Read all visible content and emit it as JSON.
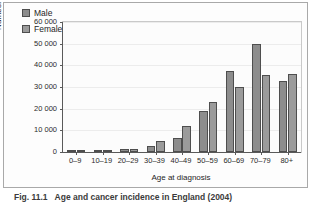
{
  "figure": {
    "caption_number": "Fig. 11.1",
    "caption_text": "Age and cancer incidence in England (2004)"
  },
  "legend": {
    "position": "top-left-inside",
    "items": [
      {
        "label": "Male",
        "color": "#8d8d8d"
      },
      {
        "label": "Female",
        "color": "#9b9b9b"
      }
    ]
  },
  "axes": {
    "y_title": "Number of new cases",
    "x_title": "Age at diagnosis",
    "y_ticks": [
      "0",
      "10 000",
      "20 000",
      "30 000",
      "40 000",
      "50 000",
      "60 000"
    ]
  },
  "chart_data": {
    "type": "bar",
    "title": "",
    "subtitle": "",
    "xlabel": "Age at diagnosis",
    "ylabel": "Number of new cases",
    "ylim": [
      0,
      60000
    ],
    "ytick_values": [
      0,
      10000,
      20000,
      30000,
      40000,
      50000,
      60000
    ],
    "ytick_labels": [
      "0",
      "10 000",
      "20 000",
      "30 000",
      "40 000",
      "50 000",
      "60 000"
    ],
    "grid": true,
    "grid_axis": "y",
    "legend_position": "upper left",
    "categories": [
      "0–9",
      "10–19",
      "20–29",
      "30–39",
      "40–49",
      "50–59",
      "60–69",
      "70–79",
      "80+"
    ],
    "series": [
      {
        "name": "Male",
        "color": "#8d8d8d",
        "values": [
          400,
          800,
          1400,
          2900,
          6400,
          19000,
          37200,
          49700,
          33000
        ]
      },
      {
        "name": "Female",
        "color": "#9b9b9b",
        "values": [
          400,
          800,
          1300,
          5100,
          11800,
          23100,
          29900,
          35700,
          36000
        ]
      }
    ]
  }
}
